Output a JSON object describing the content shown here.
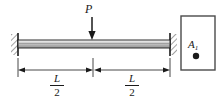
{
  "figure": {
    "type": "engineering-beam-diagram",
    "background_color": "#ffffff",
    "line_color": "#1a1a1a",
    "beam_fill_top": "#f2f2f2",
    "beam_fill_mid": "#b8b8b8",
    "beam_fill_bottom": "#9a9a9a"
  },
  "load": {
    "label": "P",
    "direction": "down",
    "position": "midspan",
    "arrow_x": 92,
    "arrow_top_y": 17,
    "arrow_tip_y": 39
  },
  "beam": {
    "left_x": 18,
    "right_x": 170,
    "top_y": 40,
    "bottom_y": 48
  },
  "supports": {
    "left": {
      "type": "fixed",
      "x": 14,
      "hatched": true
    },
    "right": {
      "type": "fixed",
      "x": 170,
      "hatched": true
    }
  },
  "dimensions": [
    {
      "name": "left-span",
      "numerator": "L",
      "denominator": "2",
      "from_x": 18,
      "to_x": 92,
      "y": 70
    },
    {
      "name": "right-span",
      "numerator": "L",
      "denominator": "2",
      "from_x": 94,
      "to_x": 170,
      "y": 70
    }
  ],
  "cross_section": {
    "label": "A",
    "subscript": "1",
    "box": {
      "x": 181,
      "y": 16,
      "width": 34,
      "height": 54
    },
    "marker": {
      "shape": "filled-circle",
      "cx": 196,
      "cy": 56,
      "r": 3.2
    }
  }
}
